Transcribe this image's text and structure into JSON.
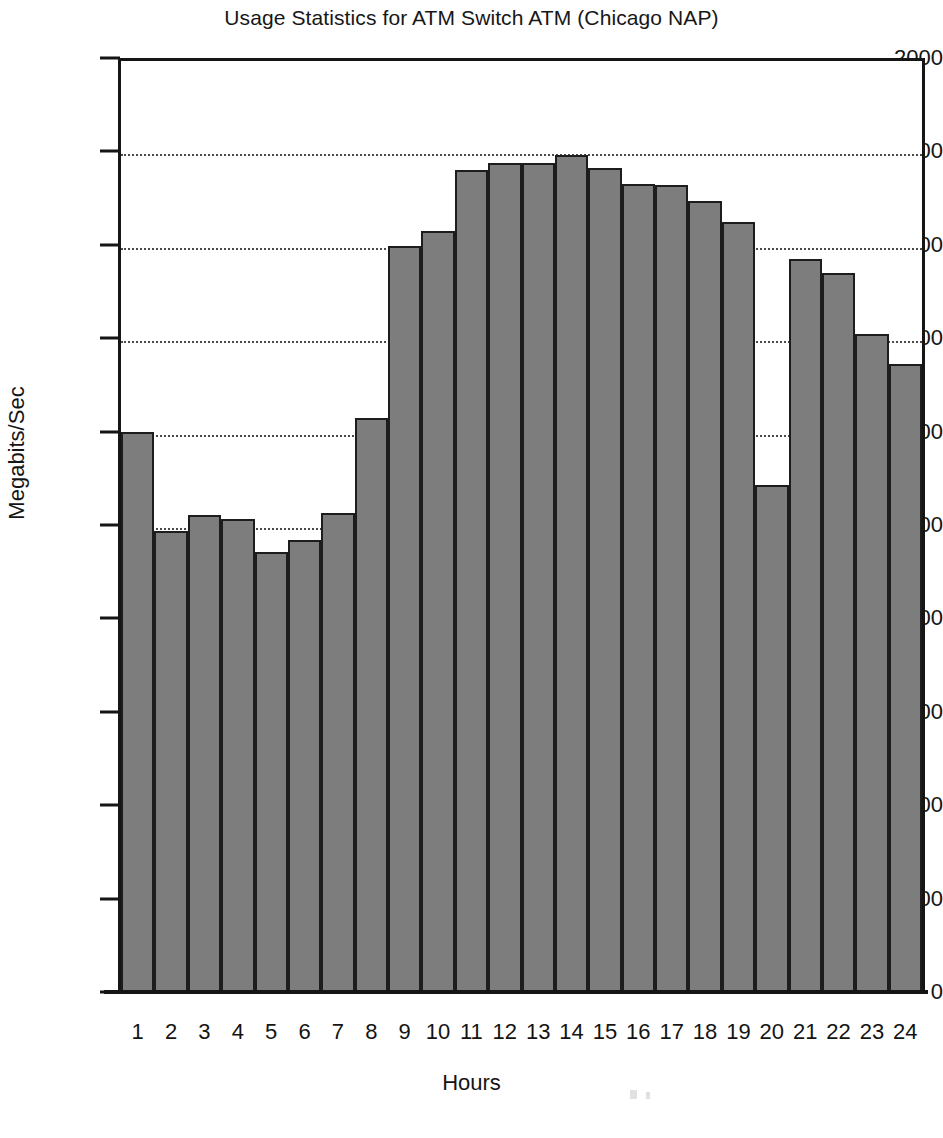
{
  "chart_data": {
    "type": "bar",
    "title": "Usage Statistics for ATM Switch ATM (Chicago NAP)",
    "xlabel": "Hours",
    "ylabel": "Megabits/Sec",
    "categories": [
      "1",
      "2",
      "3",
      "4",
      "5",
      "6",
      "7",
      "8",
      "9",
      "10",
      "11",
      "12",
      "13",
      "14",
      "15",
      "16",
      "17",
      "18",
      "19",
      "20",
      "21",
      "22",
      "23",
      "24"
    ],
    "values": [
      1200,
      988,
      1022,
      1013,
      943,
      968,
      1025,
      1230,
      1598,
      1630,
      1760,
      1775,
      1775,
      1793,
      1765,
      1730,
      1728,
      1693,
      1648,
      1085,
      1570,
      1540,
      1408,
      1345
    ],
    "series": [
      {
        "name": "Input",
        "values": [
          1200,
          988,
          1022,
          1013,
          943,
          968,
          1025,
          1230,
          1598,
          1630,
          1760,
          1775,
          1775,
          1793,
          1765,
          1730,
          1728,
          1693,
          1648,
          1085,
          1570,
          1540,
          1408,
          1345
        ]
      }
    ],
    "ylim": [
      0,
      2000
    ],
    "yticks": [
      0,
      200,
      400,
      600,
      800,
      1000,
      1200,
      1400,
      1600,
      1800,
      2000
    ],
    "ytick_labels": [
      "0",
      "200",
      "400",
      "600",
      "800",
      "1000",
      "1200",
      "1400",
      "1600",
      "1800",
      "2000"
    ],
    "grid": true,
    "gridlines_at": [
      1000,
      1200,
      1400,
      1600,
      1800
    ],
    "legend": {
      "position": "top-right",
      "entries": [
        {
          "label": "Input",
          "key_style": "dotted-line",
          "color": "#8a8a8a"
        }
      ]
    },
    "bar_fill_color": "#7d7d7d",
    "bar_edge_color": "#1d1d1d",
    "axis_color": "#151515",
    "background_color": "#ffffff"
  }
}
